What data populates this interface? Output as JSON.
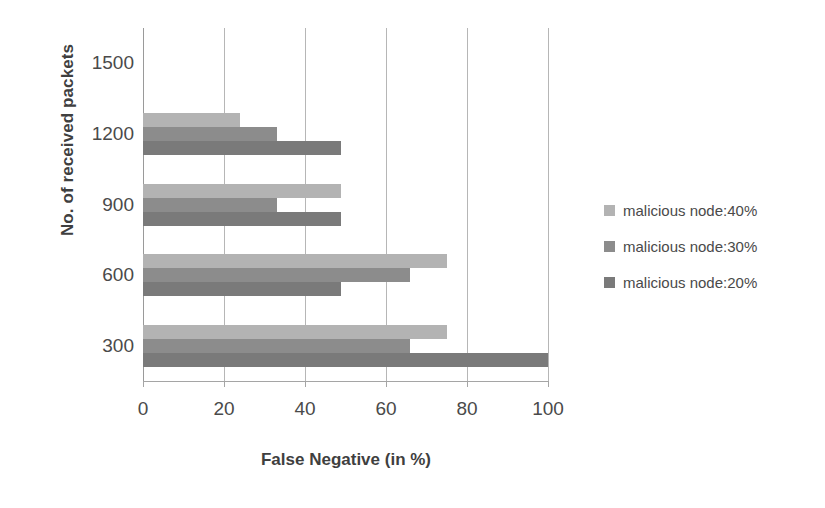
{
  "chart_data": {
    "type": "bar",
    "orientation": "horizontal",
    "title": "",
    "xlabel": "False Negative (in %)",
    "ylabel": "No. of received packets",
    "categories": [
      "1500",
      "1200",
      "900",
      "600",
      "300"
    ],
    "category_values": [
      1500,
      1200,
      900,
      600,
      300
    ],
    "xlim": [
      0,
      100
    ],
    "xticks": [
      0,
      20,
      40,
      60,
      80,
      100
    ],
    "xtick_labels": [
      "0",
      "20",
      "40",
      "60",
      "80",
      "100"
    ],
    "yticks": [
      300,
      600,
      900,
      1200,
      1500
    ],
    "ytick_labels": [
      "300",
      "600",
      "900",
      "1200",
      "1500"
    ],
    "grid": "vertical",
    "legend_position": "right",
    "series": [
      {
        "name": "malicious node:40%",
        "color": "#b3b3b3",
        "categories": [
          "1500",
          "1200",
          "900",
          "600",
          "300"
        ],
        "values": [
          0,
          24,
          49,
          75,
          75
        ]
      },
      {
        "name": "malicious node:30%",
        "color": "#8c8c8c",
        "categories": [
          "1500",
          "1200",
          "900",
          "600",
          "300"
        ],
        "values": [
          0,
          33,
          33,
          66,
          66
        ]
      },
      {
        "name": "malicious node:20%",
        "color": "#7a7a7a",
        "categories": [
          "1500",
          "1200",
          "900",
          "600",
          "300"
        ],
        "values": [
          0,
          49,
          49,
          49,
          100
        ]
      }
    ]
  },
  "axes": {
    "y_title": "No. of received packets",
    "x_title": "False Negative (in %)",
    "y_tick_labels": [
      "1500",
      "1200",
      "900",
      "600",
      "300"
    ],
    "x_tick_labels": [
      "0",
      "20",
      "40",
      "60",
      "80",
      "100"
    ]
  },
  "legend": {
    "items": [
      {
        "label": "malicious node:40%",
        "color": "#b3b3b3"
      },
      {
        "label": "malicious node:30%",
        "color": "#8c8c8c"
      },
      {
        "label": "malicious node:20%",
        "color": "#7a7a7a"
      }
    ]
  },
  "colors": {
    "background": "#ffffff",
    "gridline": "#b6b6b6",
    "axis": "#9a9a9a",
    "text": "#4a4a4a",
    "title_text": "#3f3f3f"
  }
}
